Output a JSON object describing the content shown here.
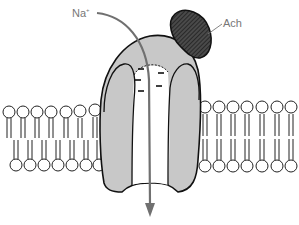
{
  "labels": {
    "ion": "Na",
    "ion_charge": "+",
    "ligand": "Ach"
  },
  "colors": {
    "protein_fill": "#c8c8c8",
    "protein_stroke": "#111111",
    "ligand_fill": "#3a3a3a",
    "arrow": "#707070",
    "label": "#777777",
    "lipid_stroke": "#222222",
    "background": "#ffffff"
  },
  "membrane": {
    "left_upper_heads": 7,
    "left_lower_heads": 7,
    "right_upper_heads": 7,
    "right_lower_heads": 7
  },
  "channel": {
    "pore_charges": 5
  }
}
